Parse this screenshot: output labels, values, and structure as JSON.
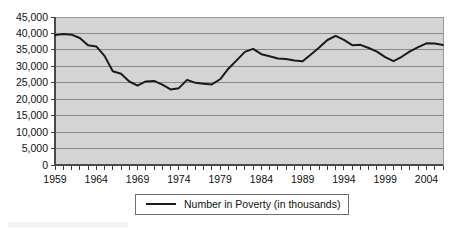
{
  "chart_data": {
    "type": "line",
    "title": "",
    "xlabel": "",
    "ylabel": "",
    "ylim": [
      0,
      45000
    ],
    "xlim": [
      1959,
      2006
    ],
    "grid": true,
    "legend_position": "bottom",
    "y_ticks": [
      0,
      5000,
      10000,
      15000,
      20000,
      25000,
      30000,
      35000,
      40000,
      45000
    ],
    "y_tick_labels": [
      "0",
      "5,000",
      "10,000",
      "15,000",
      "20,000",
      "25,000",
      "30,000",
      "35,000",
      "40,000",
      "45,000"
    ],
    "x_tick_labels": [
      "1959",
      "1964",
      "1969",
      "1974",
      "1979",
      "1984",
      "1989",
      "1994",
      "1999",
      "2004"
    ],
    "x_tick_years": [
      1959,
      1964,
      1969,
      1974,
      1979,
      1984,
      1989,
      1994,
      1999,
      2004
    ],
    "x_minor_tick_step_years": 1,
    "series": [
      {
        "name": "Number in Poverty (in thousands)",
        "color": "#1a1a1a",
        "x": [
          1959,
          1960,
          1961,
          1962,
          1963,
          1964,
          1965,
          1966,
          1967,
          1968,
          1969,
          1970,
          1971,
          1972,
          1973,
          1974,
          1975,
          1976,
          1977,
          1978,
          1979,
          1980,
          1981,
          1982,
          1983,
          1984,
          1985,
          1986,
          1987,
          1988,
          1989,
          1990,
          1991,
          1992,
          1993,
          1994,
          1995,
          1996,
          1997,
          1998,
          1999,
          2000,
          2001,
          2002,
          2003,
          2004,
          2005,
          2006
        ],
        "values": [
          39490,
          39850,
          39630,
          38625,
          36440,
          36055,
          33185,
          28510,
          27770,
          25390,
          24150,
          25420,
          25560,
          24460,
          22970,
          23370,
          25880,
          24975,
          24720,
          24500,
          26070,
          29270,
          31820,
          34400,
          35300,
          33700,
          33060,
          32370,
          32220,
          31745,
          31530,
          33585,
          35710,
          38010,
          39265,
          38060,
          36430,
          36530,
          35570,
          34480,
          32790,
          31580,
          32910,
          34570,
          35860,
          36997,
          36950,
          36460
        ]
      }
    ],
    "legend": [
      {
        "label": "Number in Poverty (in thousands)",
        "marker": "line",
        "color": "#1a1a1a"
      }
    ],
    "colors": {
      "plot_background": "#d4d4d4",
      "gridline": "#8a8a8a",
      "axis": "#4a4a4a",
      "series": "#1a1a1a",
      "page_background": "#ffffff"
    }
  }
}
